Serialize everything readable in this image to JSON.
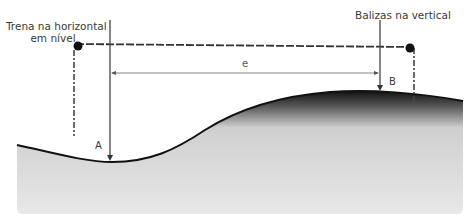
{
  "diagram": {
    "labels": {
      "tape": "Trena na horizontal em nível",
      "tape_line1": "Trena na horizontal",
      "tape_line2": "em nível",
      "poles": "Balizas na vertical",
      "point_a": "A",
      "point_b": "B",
      "distance": "e"
    },
    "colors": {
      "ground_fill": "#e6e6e6",
      "ground_edge": "#1a1a1a",
      "line": "#444444",
      "text": "#3a3a3a"
    }
  }
}
